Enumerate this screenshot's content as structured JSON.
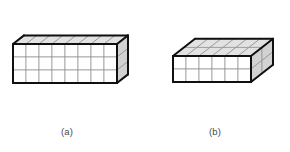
{
  "figure": {
    "background_color": "#ffffff",
    "width": 290,
    "height": 152,
    "projection": "isometric",
    "style": {
      "front_face_color": "#ffffff",
      "top_face_color": "#e2e2e2",
      "right_face_color": "#d2d2d2",
      "grid_line_color": "#8f8f8f",
      "outline_color": "#101010",
      "outline_width": 2.0,
      "grid_line_width": 0.7,
      "caption_color": "#4a4a4a"
    },
    "panels": [
      {
        "id": "a",
        "caption": "(a)",
        "description": "rectangular wall of unit cubes, one cube deep",
        "dimensions": {
          "length": 8,
          "height": 3,
          "depth": 1
        },
        "cube_count": 24,
        "origin": {
          "x": 13,
          "y": 44
        },
        "cube_size": 13.0,
        "depth_dx": 11.0,
        "depth_dy": -8.6
      },
      {
        "id": "b",
        "caption": "(b)",
        "description": "rectangular box of unit cubes, two cubes deep",
        "dimensions": {
          "length": 6,
          "height": 2,
          "depth": 2
        },
        "cube_count": 24,
        "origin": {
          "x": 173,
          "y": 56
        },
        "cube_size": 13.0,
        "depth_dx": 11.0,
        "depth_dy": -8.6
      }
    ]
  },
  "chart_data": {
    "type": "diagram",
    "series": [
      {
        "name": "(a)",
        "length": 8,
        "height": 3,
        "depth": 1,
        "total_cubes": 24
      },
      {
        "name": "(b)",
        "length": 6,
        "height": 2,
        "depth": 2,
        "total_cubes": 24
      }
    ],
    "labels": [
      "(a)",
      "(b)"
    ]
  }
}
